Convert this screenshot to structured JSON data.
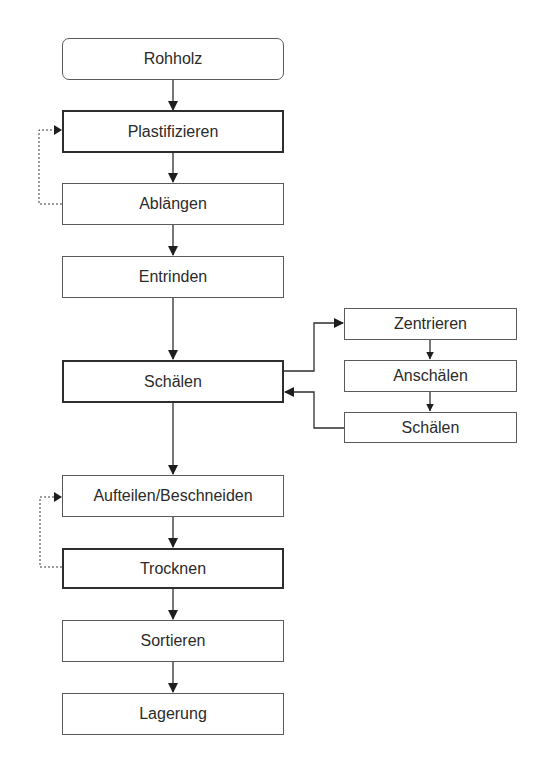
{
  "diagram": {
    "type": "flowchart",
    "nodes": {
      "rohholz": "Rohholz",
      "plastifizieren": "Plastifizieren",
      "ablaengen": "Ablängen",
      "entrinden": "Entrinden",
      "schaelen": "Schälen",
      "zentrieren": "Zentrieren",
      "anschaelen": "Anschälen",
      "schaelen_sub": "Schälen",
      "aufteilen": "Aufteilen/Beschneiden",
      "trocknen": "Trocknen",
      "sortieren": "Sortieren",
      "lagerung": "Lagerung"
    },
    "edges": [
      {
        "from": "Rohholz",
        "to": "Plastifizieren",
        "style": "solid"
      },
      {
        "from": "Plastifizieren",
        "to": "Ablängen",
        "style": "solid"
      },
      {
        "from": "Ablängen",
        "to": "Plastifizieren",
        "style": "dashed"
      },
      {
        "from": "Ablängen",
        "to": "Entrinden",
        "style": "solid"
      },
      {
        "from": "Entrinden",
        "to": "Schälen",
        "style": "solid"
      },
      {
        "from": "Schälen",
        "to": "Zentrieren",
        "style": "solid"
      },
      {
        "from": "Zentrieren",
        "to": "Anschälen",
        "style": "solid"
      },
      {
        "from": "Anschälen",
        "to": "Schälen (sub)",
        "style": "solid"
      },
      {
        "from": "Schälen (sub)",
        "to": "Schälen",
        "style": "solid"
      },
      {
        "from": "Schälen",
        "to": "Aufteilen/Beschneiden",
        "style": "solid"
      },
      {
        "from": "Aufteilen/Beschneiden",
        "to": "Trocknen",
        "style": "solid"
      },
      {
        "from": "Trocknen",
        "to": "Aufteilen/Beschneiden",
        "style": "dashed"
      },
      {
        "from": "Trocknen",
        "to": "Sortieren",
        "style": "solid"
      },
      {
        "from": "Sortieren",
        "to": "Lagerung",
        "style": "solid"
      }
    ],
    "colors": {
      "line": "#2e2e2e",
      "border": "#5a5a5a",
      "text": "#2b2b2b",
      "background": "#ffffff"
    }
  }
}
